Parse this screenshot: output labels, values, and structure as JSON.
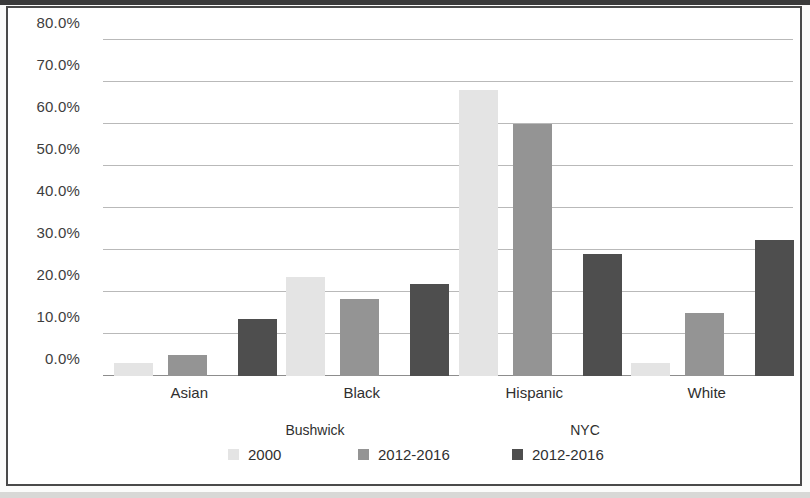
{
  "chart_data": {
    "type": "bar",
    "title": "",
    "xlabel": "",
    "ylabel": "",
    "categories": [
      "Asian",
      "Black",
      "Hispanic",
      "White"
    ],
    "series": [
      {
        "name": "2000",
        "group": "Bushwick",
        "color": "#e4e4e4",
        "values": [
          3.0,
          23.5,
          68.0,
          3.0
        ]
      },
      {
        "name": "2012-2016",
        "group": "Bushwick",
        "color": "#949494",
        "values": [
          5.0,
          18.3,
          60.0,
          15.0
        ]
      },
      {
        "name": "2012-2016",
        "group": "NYC",
        "color": "#4e4e4e",
        "values": [
          13.5,
          22.0,
          29.0,
          32.3
        ]
      }
    ],
    "ylim": [
      0,
      80
    ],
    "ytick_values": [
      0,
      10,
      20,
      30,
      40,
      50,
      60,
      70,
      80
    ],
    "ytick_labels": [
      "0.0%",
      "10.0%",
      "20.0%",
      "30.0%",
      "40.0%",
      "50.0%",
      "60.0%",
      "70.0%",
      "80.0%"
    ],
    "grid": true,
    "legend_position": "bottom",
    "legend_groups": [
      "Bushwick",
      "NYC"
    ]
  },
  "axis": {
    "yticks": [
      {
        "label": "80.0%",
        "value": 80
      },
      {
        "label": "70.0%",
        "value": 70
      },
      {
        "label": "60.0%",
        "value": 60
      },
      {
        "label": "50.0%",
        "value": 50
      },
      {
        "label": "40.0%",
        "value": 40
      },
      {
        "label": "30.0%",
        "value": 30
      },
      {
        "label": "20.0%",
        "value": 20
      },
      {
        "label": "10.0%",
        "value": 10
      },
      {
        "label": "0.0%",
        "value": 0
      }
    ],
    "categories": [
      "Asian",
      "Black",
      "Hispanic",
      "White"
    ]
  },
  "legend": {
    "groups": [
      {
        "title": "Bushwick"
      },
      {
        "title": "NYC"
      }
    ],
    "entries": [
      {
        "label": "2000",
        "color": "#e4e4e4"
      },
      {
        "label": "2012-2016",
        "color": "#949494"
      },
      {
        "label": "2012-2016",
        "color": "#4e4e4e"
      }
    ]
  },
  "colors": {
    "series_light": "#e4e4e4",
    "series_mid": "#949494",
    "series_dark": "#4e4e4e",
    "gridline": "#b9b9b9",
    "frame": "#4a4a4a",
    "text": "#2f2f2f"
  }
}
